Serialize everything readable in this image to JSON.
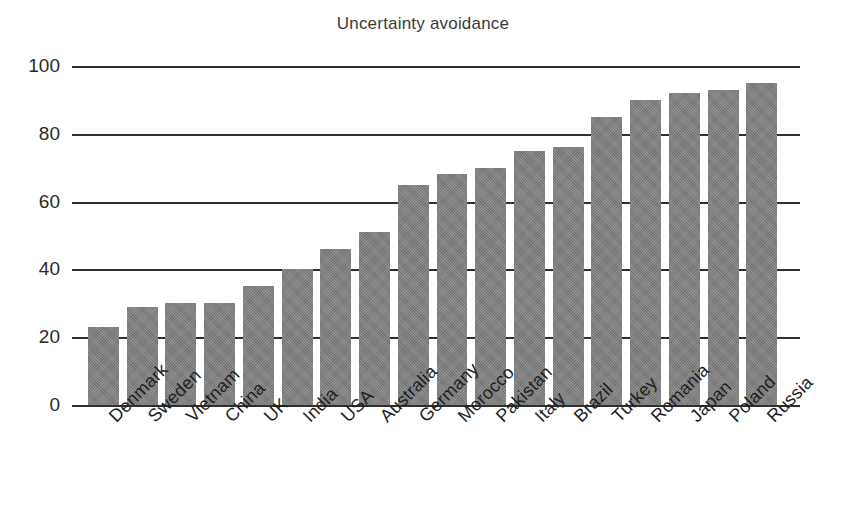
{
  "chart_data": {
    "type": "bar",
    "title": "Uncertainty avoidance",
    "xlabel": "",
    "ylabel": "",
    "ylim": [
      0,
      100
    ],
    "yticks": [
      0,
      20,
      40,
      60,
      80,
      100
    ],
    "grid": true,
    "legend": "none",
    "orientation": "vertical",
    "bar_color": "#807f80",
    "categories": [
      "Denmark",
      "Sweden",
      "Vietnam",
      "China",
      "UK",
      "India",
      "USA",
      "Australia",
      "Germany",
      "Morocco",
      "Pakistan",
      "Italy",
      "Brazil",
      "Turkey",
      "Romania",
      "Japan",
      "Poland",
      "Russia"
    ],
    "values": [
      23,
      29,
      30,
      30,
      35,
      40,
      46,
      51,
      65,
      68,
      70,
      75,
      76,
      85,
      90,
      92,
      93,
      95
    ]
  }
}
